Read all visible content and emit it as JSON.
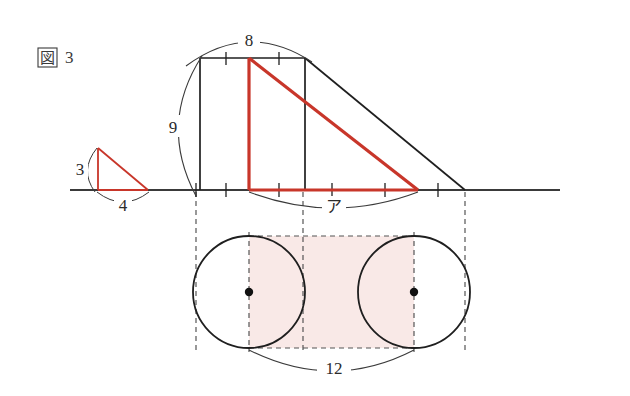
{
  "figure": {
    "label_kanji": "図",
    "label_number": "3",
    "colors": {
      "ink": "#3a3a3a",
      "line": "#2b2b2b",
      "accent_red": "#c8362a",
      "shade_pink": "#f9e9e7",
      "dash": "#555555",
      "background": "#ffffff"
    }
  },
  "small_triangle": {
    "name": "small-red-right-triangle",
    "height_label": "3",
    "base_label": "4",
    "apex": {
      "x": 98,
      "y": 148
    },
    "bottom_left": {
      "x": 98,
      "y": 190
    },
    "bottom_right": {
      "x": 148,
      "y": 190
    }
  },
  "main_figure": {
    "rect_top_label": "8",
    "rect_height_label": "9",
    "region_label": "ア",
    "rect": {
      "left": 200,
      "top": 58,
      "right": 305,
      "bottom": 190
    },
    "red_vertical_x": 249,
    "red_base_right_x": 418,
    "diagonal_end_x": 465,
    "baseline_y": 190,
    "baseline_left_x": 70,
    "baseline_right_x": 560
  },
  "bottom_figure": {
    "width_label": "12",
    "left_circle": {
      "cx": 249,
      "cy": 292,
      "r": 56
    },
    "right_circle": {
      "cx": 414,
      "cy": 292,
      "r": 56
    },
    "shaded_rect": {
      "left": 249,
      "top": 236,
      "right": 414,
      "bottom": 348
    }
  },
  "tick_marks": {
    "top_edge_x": [
      226,
      279
    ],
    "bottom_edge_x": [
      226,
      279,
      332,
      385,
      438
    ],
    "baseline_left_x": [
      196
    ]
  }
}
